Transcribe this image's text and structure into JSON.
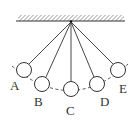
{
  "diagram": {
    "labels": {
      "A": "A",
      "B": "B",
      "C": "C",
      "D": "D",
      "E": "E"
    },
    "colors": {
      "stroke": "#333333",
      "background": "#ffffff"
    }
  }
}
